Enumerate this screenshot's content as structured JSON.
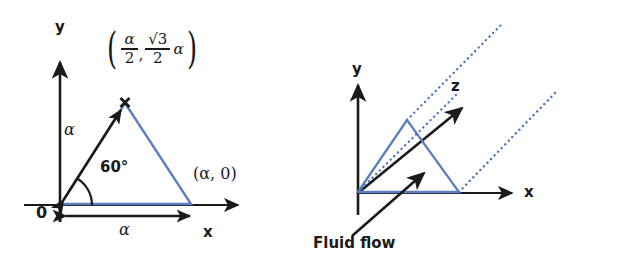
{
  "figure": {
    "background": "#ffffff",
    "ink_color": "#1a1a1a",
    "accent_blue": "#5b7fc0",
    "panels": [
      {
        "id": "left-panel",
        "name": "equilateral-triangle-coordinates",
        "axis_y_label": "y",
        "axis_x_label": "x",
        "origin_label": "0",
        "angle_label": "60°",
        "side_length_label": "α",
        "base_length_label": "α",
        "vertex_marker": "×",
        "apex_coordinate": {
          "open_paren": "(",
          "x_numerator": "α",
          "x_denominator": "2",
          "comma": ",",
          "y_numerator": "√3",
          "y_denominator": "2",
          "y_trailing": "α",
          "close_paren": ")"
        },
        "base_vertex_label": "(α, 0)"
      },
      {
        "id": "right-panel",
        "name": "extruded-prism-fluid-flow",
        "axis_y_label": "y",
        "axis_x_label": "x",
        "axis_z_label": "z",
        "flow_label": "Fluid flow",
        "dotted_line_count": 3
      }
    ]
  }
}
